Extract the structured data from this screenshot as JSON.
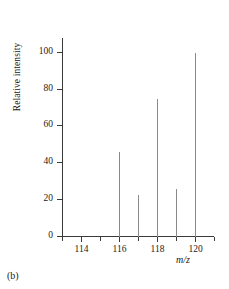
{
  "figure": {
    "caption": "(b)"
  },
  "chart_data": {
    "type": "bar",
    "title": "",
    "subtitle": "",
    "xlabel": "m/z",
    "ylabel": "Relative intensity",
    "categories": [
      116,
      117,
      118,
      119,
      120
    ],
    "values": [
      46,
      23,
      75,
      26,
      100
    ],
    "x": [
      116,
      117,
      118,
      119,
      120
    ],
    "xlim": [
      113,
      121
    ],
    "ylim": [
      0,
      108
    ],
    "grid": false,
    "legend": null,
    "legend_position": "none",
    "x_tick_labels": [
      "114",
      "116",
      "118",
      "120"
    ],
    "x_tick_values": [
      114,
      116,
      118,
      120
    ],
    "x_minor_tick_values": [
      113,
      115,
      117,
      119,
      121
    ],
    "y_tick_labels": [
      "0",
      "20",
      "40",
      "60",
      "80",
      "100"
    ],
    "y_tick_values": [
      0,
      20,
      40,
      60,
      80,
      100
    ],
    "series": [
      {
        "name": "Relative intensity",
        "color": "#8a8a8a",
        "values": [
          46,
          23,
          75,
          26,
          100
        ]
      }
    ],
    "annotations": []
  },
  "colors": {
    "axis": "#3a3a3a",
    "peak": "#8a8a8a",
    "text": "#1a1a1a",
    "background": "#ffffff"
  }
}
